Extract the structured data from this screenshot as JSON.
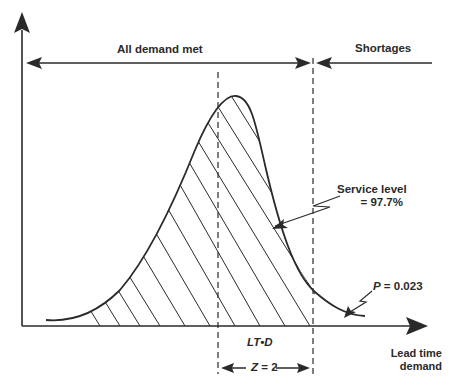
{
  "diagram": {
    "labels": {
      "all_demand_met": "All demand met",
      "shortages": "Shortages",
      "service_level_line1": "Service level",
      "service_level_line2": "= 97.7%",
      "p_prefix": "P",
      "p_value": " = 0.023",
      "mean": "LT•D",
      "z_prefix": "Z",
      "z_value": " = 2",
      "x_axis_line1": "Lead time",
      "x_axis_line2": "demand"
    },
    "values": {
      "service_level_percent": 97.7,
      "stockout_probability": 0.023,
      "z": 2
    },
    "colors": {
      "ink": "#2a2a2a",
      "background": "#ffffff"
    }
  }
}
